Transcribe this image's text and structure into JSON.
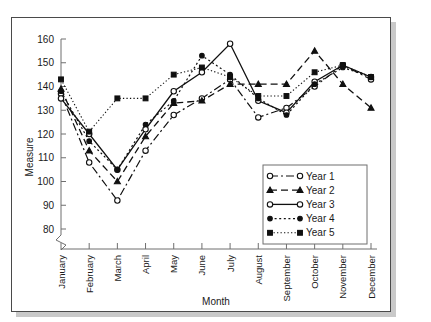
{
  "figure": {
    "frame_border_color": "#4a4a4a",
    "shadow_color": "#c9c9c9",
    "background": "#ffffff"
  },
  "chart_data": {
    "type": "line",
    "title": "",
    "xlabel": "Month",
    "ylabel": "Measure",
    "categories": [
      "January",
      "February",
      "March",
      "April",
      "May",
      "June",
      "July",
      "August",
      "September",
      "October",
      "November",
      "December"
    ],
    "ytick_labels": [
      "80",
      "90",
      "100",
      "110",
      "120",
      "130",
      "140",
      "150",
      "160"
    ],
    "ytick_values": [
      80,
      90,
      100,
      110,
      120,
      130,
      140,
      150,
      160
    ],
    "ylim": [
      80,
      162
    ],
    "axis_break": true,
    "grid": false,
    "legend_position": "lower right",
    "series": [
      {
        "name": "Year 1",
        "marker": "open-circle",
        "dash": "dash-dot",
        "values": [
          137,
          108,
          92,
          113,
          128,
          135,
          143,
          127,
          131,
          140,
          149,
          143
        ]
      },
      {
        "name": "Year 2",
        "marker": "filled-triangle",
        "dash": "dashed",
        "values": [
          139,
          113,
          100,
          119,
          133,
          134,
          141,
          141,
          141,
          155,
          141,
          131
        ]
      },
      {
        "name": "Year 3",
        "marker": "open-circle",
        "dash": "solid",
        "values": [
          135,
          120,
          105,
          122,
          138,
          146,
          158,
          134,
          129,
          142,
          149,
          144
        ]
      },
      {
        "name": "Year 4",
        "marker": "filled-circle",
        "dash": "dotted",
        "values": [
          138,
          117,
          105,
          124,
          134,
          153,
          145,
          135,
          128,
          141,
          148,
          144
        ]
      },
      {
        "name": "Year 5",
        "marker": "filled-square",
        "dash": "dotted-fine",
        "values": [
          143,
          121,
          135,
          135,
          145,
          148,
          144,
          136,
          136,
          146,
          149,
          144
        ]
      }
    ]
  }
}
